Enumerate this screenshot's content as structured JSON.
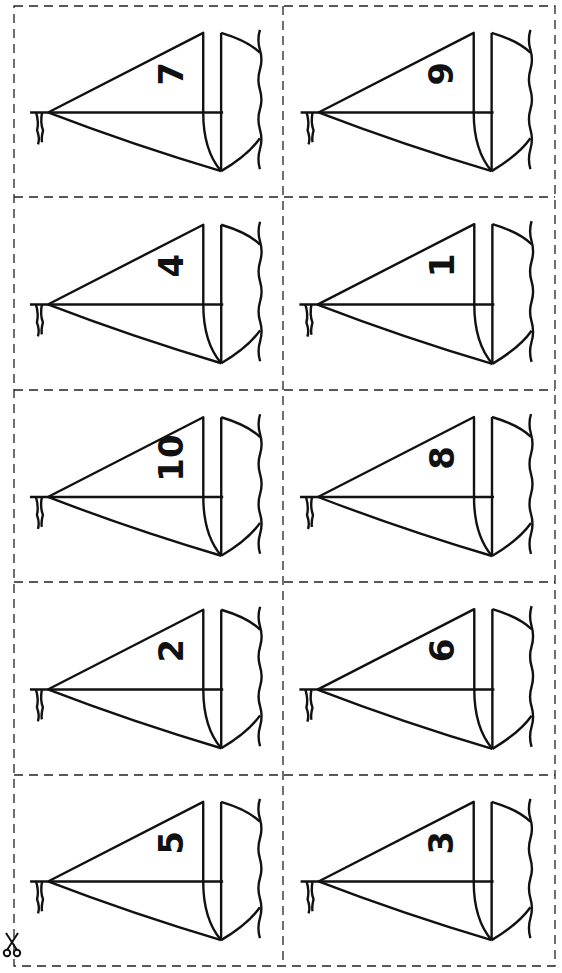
{
  "page": {
    "colors": {
      "ink": "#111111",
      "background": "#ffffff"
    }
  },
  "cards": [
    {
      "row": 0,
      "col": 0,
      "number": "7"
    },
    {
      "row": 0,
      "col": 1,
      "number": "9"
    },
    {
      "row": 1,
      "col": 0,
      "number": "4"
    },
    {
      "row": 1,
      "col": 1,
      "number": "1"
    },
    {
      "row": 2,
      "col": 0,
      "number": "10"
    },
    {
      "row": 2,
      "col": 1,
      "number": "8"
    },
    {
      "row": 3,
      "col": 0,
      "number": "2"
    },
    {
      "row": 3,
      "col": 1,
      "number": "6"
    },
    {
      "row": 4,
      "col": 0,
      "number": "5"
    },
    {
      "row": 4,
      "col": 1,
      "number": "3"
    }
  ],
  "icons": {
    "cut_mark": "scissors-icon"
  }
}
